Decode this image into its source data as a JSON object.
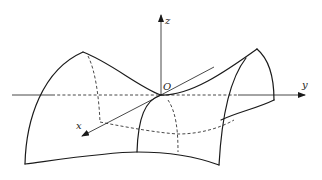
{
  "figure": {
    "labels": {
      "x_axis": "x",
      "y_axis": "y",
      "z_axis": "z",
      "origin": "O"
    },
    "colors": {
      "stroke": "#1a1a1a",
      "background": "#ffffff"
    }
  }
}
